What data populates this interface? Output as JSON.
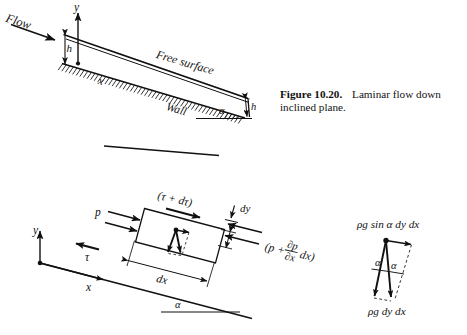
{
  "figure": {
    "caption_label": "Figure 10.20.",
    "caption_text": "Laminar flow down inclined plane.",
    "ink_color": "#111111",
    "background_color": "#ffffff"
  },
  "top_diagram": {
    "name": "laminar-flow-down-inclined-plane",
    "flow_label": "Flow",
    "y_axis_label": "y",
    "x_axis_label": "x",
    "depth_label_left": "h",
    "depth_label_right": "h",
    "free_surface_label": "Free surface",
    "wall_label": "Wall",
    "angle_label": "α"
  },
  "lower_diagram": {
    "name": "fluid-element-force-balance",
    "y_axis_label": "y",
    "x_axis_label": "x",
    "angle_label": "α",
    "shear_top_label": "(τ + dτ)",
    "shear_bottom_label": "τ",
    "pressure_left_label": "p",
    "pressure_right_prefix": "(p +",
    "pressure_right_num": "∂p",
    "pressure_right_den": "∂x",
    "pressure_right_suffix": "dx)",
    "height_label": "dy",
    "width_label": "dx"
  },
  "force_triangle": {
    "name": "gravity-force-components",
    "top_label": "ρg sin α dy dx",
    "bottom_label": "ρg dy dx",
    "angle_label_left": "α",
    "angle_label_right": "α"
  },
  "stray_rule": {
    "name": "stray-rule-segment"
  }
}
